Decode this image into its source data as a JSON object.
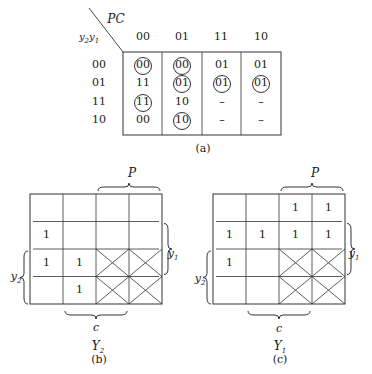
{
  "table_a": {
    "corner_top_label": "PC",
    "corner_left_label": "y2y1",
    "column_headers": [
      "00",
      "01",
      "11",
      "10"
    ],
    "row_headers": [
      "00",
      "01",
      "11",
      "10"
    ],
    "cells": [
      [
        {
          "v": "00",
          "circled": true
        },
        {
          "v": "00",
          "circled": true
        },
        {
          "v": "01",
          "circled": false
        },
        {
          "v": "01",
          "circled": false
        }
      ],
      [
        {
          "v": "11",
          "circled": false
        },
        {
          "v": "01",
          "circled": true
        },
        {
          "v": "01",
          "circled": true
        },
        {
          "v": "01",
          "circled": true
        }
      ],
      [
        {
          "v": "11",
          "circled": true
        },
        {
          "v": "10",
          "circled": false
        },
        {
          "v": "–",
          "circled": false
        },
        {
          "v": "–",
          "circled": false
        }
      ],
      [
        {
          "v": "00",
          "circled": false
        },
        {
          "v": "10",
          "circled": true
        },
        {
          "v": "–",
          "circled": false
        },
        {
          "v": "–",
          "circled": false
        }
      ]
    ],
    "caption": "(a)"
  },
  "map_b": {
    "title": "Y2",
    "caption": "(b)",
    "brace_top": "P",
    "brace_right": "y1",
    "brace_left": "y2",
    "brace_bottom": "c",
    "cells": [
      [
        "",
        "",
        "",
        ""
      ],
      [
        "1",
        "",
        "",
        ""
      ],
      [
        "1",
        "1",
        "X",
        "X"
      ],
      [
        "",
        "1",
        "X",
        "X"
      ]
    ]
  },
  "map_c": {
    "title": "Y1",
    "caption": "(c)",
    "brace_top": "P",
    "brace_right": "y1",
    "brace_left": "y2",
    "brace_bottom": "c",
    "cells": [
      [
        "",
        "",
        "1",
        "1"
      ],
      [
        "1",
        "1",
        "1",
        "1"
      ],
      [
        "1",
        "",
        "X",
        "X"
      ],
      [
        "",
        "",
        "X",
        "X"
      ]
    ]
  }
}
